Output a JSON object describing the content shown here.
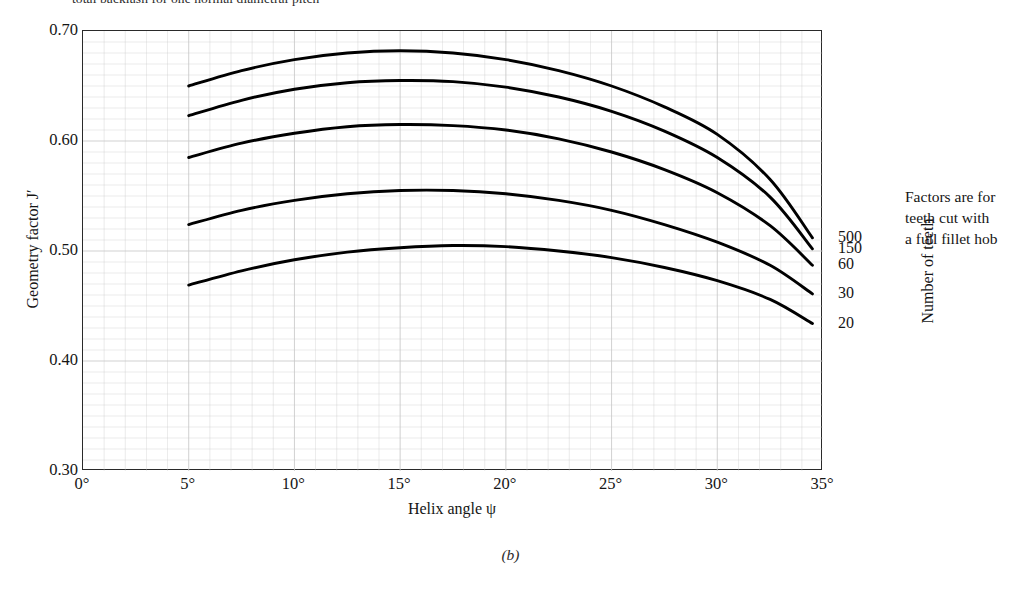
{
  "figure": {
    "top_note": "total backlash for one normal diametral pitch",
    "caption": "(b)",
    "side_note_lines": [
      "Factors are for",
      "teeth cut with",
      "a full fillet hob"
    ],
    "side_note": "Factors are for teeth cut with a full fillet hob",
    "teeth_axis_title": "Number of teeth"
  },
  "chart_data": {
    "type": "line",
    "title": "",
    "xlabel": "Helix angle ψ",
    "ylabel": "Geometry factor J′",
    "xlim": [
      0,
      35
    ],
    "ylim": [
      0.3,
      0.7
    ],
    "grid": true,
    "grid_x_step": 1,
    "grid_y_step": 0.01,
    "legend_position": "right-of-axes",
    "legend_title": "Number of teeth",
    "xticks": [
      0,
      5,
      10,
      15,
      20,
      25,
      30,
      35
    ],
    "xticklabels": [
      "0°",
      "5°",
      "10°",
      "15°",
      "20°",
      "25°",
      "30°",
      "35°"
    ],
    "yticks": [
      0.3,
      0.4,
      0.5,
      0.6,
      0.7
    ],
    "yticklabels": [
      "0.30",
      "0.40",
      "0.50",
      "0.60",
      "0.70"
    ],
    "x": [
      5,
      7.5,
      10,
      12.5,
      15,
      17.5,
      20,
      22.5,
      25,
      27.5,
      30,
      32.5,
      34.5
    ],
    "series": [
      {
        "name": "500",
        "label": "500",
        "values": [
          0.65,
          0.664,
          0.674,
          0.68,
          0.682,
          0.68,
          0.674,
          0.664,
          0.65,
          0.631,
          0.606,
          0.565,
          0.512
        ]
      },
      {
        "name": "150",
        "label": "150",
        "values": [
          0.623,
          0.637,
          0.647,
          0.653,
          0.655,
          0.654,
          0.649,
          0.64,
          0.627,
          0.609,
          0.585,
          0.549,
          0.502
        ]
      },
      {
        "name": "60",
        "label": "60",
        "values": [
          0.585,
          0.598,
          0.607,
          0.613,
          0.615,
          0.614,
          0.61,
          0.602,
          0.59,
          0.574,
          0.553,
          0.523,
          0.487
        ]
      },
      {
        "name": "30",
        "label": "30",
        "values": [
          0.524,
          0.537,
          0.546,
          0.552,
          0.555,
          0.555,
          0.552,
          0.546,
          0.537,
          0.524,
          0.508,
          0.487,
          0.461
        ]
      },
      {
        "name": "20",
        "label": "20",
        "values": [
          0.469,
          0.482,
          0.492,
          0.499,
          0.503,
          0.505,
          0.504,
          0.5,
          0.494,
          0.485,
          0.473,
          0.456,
          0.434
        ]
      }
    ]
  },
  "colors": {
    "curve": "#000000",
    "axis": "#2a2a2a",
    "grid": "#c9c9c9",
    "text": "#151515"
  }
}
